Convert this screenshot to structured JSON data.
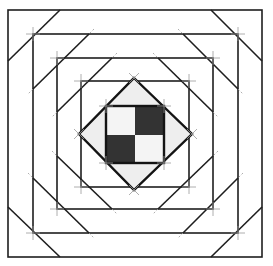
{
  "diagram": {
    "title": "",
    "type": "log-cabin quilt block construction diagram",
    "colors": {
      "line": "#1e1e1e",
      "guide": "#9a9a9a",
      "background": "#ffffff",
      "diamond_fill": "#eeeeee",
      "dark_square": "#333333",
      "light_square": "#f4f4f4"
    },
    "squares": [
      {
        "id": "square-1",
        "x1": 8,
        "y1": 10,
        "x2": 262,
        "y2": 257
      },
      {
        "id": "square-2",
        "x1": 33,
        "y1": 34,
        "x2": 238,
        "y2": 233
      },
      {
        "id": "square-3",
        "x1": 57,
        "y1": 58,
        "x2": 213,
        "y2": 209
      },
      {
        "id": "square-4",
        "x1": 81,
        "y1": 81,
        "x2": 189,
        "y2": 187
      }
    ],
    "diamond": {
      "top": [
        134,
        78
      ],
      "right": [
        192,
        134
      ],
      "bottom": [
        134,
        190
      ],
      "left": [
        79,
        134
      ]
    },
    "center_square": {
      "x1": 106,
      "y1": 106,
      "x2": 164,
      "y2": 163,
      "cells": [
        "light",
        "dark",
        "dark",
        "light"
      ]
    }
  }
}
